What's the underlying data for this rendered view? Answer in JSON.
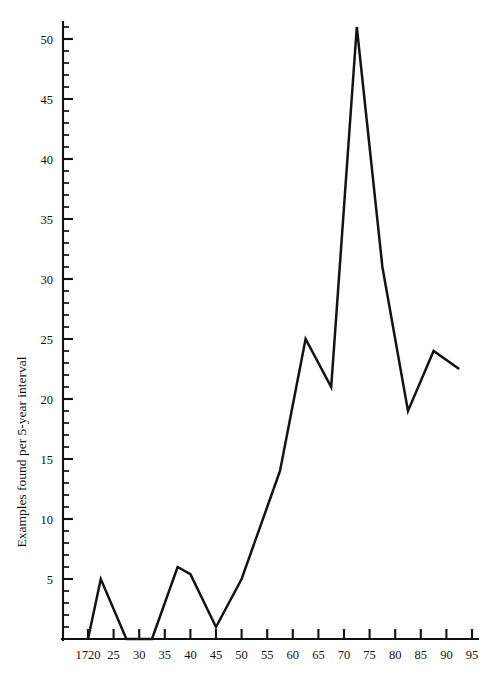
{
  "chart_data": {
    "type": "line",
    "title": "",
    "subtitle": "",
    "xlabel": "",
    "ylabel": "Examples found per 5-year interval",
    "xlim": [
      1715,
      1797
    ],
    "ylim": [
      0,
      52
    ],
    "grid": false,
    "legend": null,
    "annotations": [],
    "x_tick_labels": [
      "1720",
      "25",
      "30",
      "35",
      "40",
      "45",
      "50",
      "55",
      "60",
      "65",
      "70",
      "75",
      "80",
      "85",
      "90",
      "95"
    ],
    "x_tick_values": [
      1720,
      1725,
      1730,
      1735,
      1740,
      1745,
      1750,
      1755,
      1760,
      1765,
      1770,
      1775,
      1780,
      1785,
      1790,
      1795
    ],
    "y_tick_labels": [
      "5",
      "10",
      "15",
      "20",
      "25",
      "30",
      "35",
      "40",
      "45",
      "50"
    ],
    "y_tick_values": [
      5,
      10,
      15,
      20,
      25,
      30,
      35,
      40,
      45,
      50
    ],
    "y_minor_step": 1,
    "series": [
      {
        "name": "Examples found per 5-year interval",
        "color": "#131313",
        "x": [
          1720,
          1722.5,
          1727.5,
          1732.5,
          1737.5,
          1740,
          1745,
          1750,
          1755,
          1757.5,
          1762.5,
          1767.5,
          1772.5,
          1777.5,
          1782.5,
          1787.5,
          1792.5
        ],
        "values": [
          0,
          5,
          0,
          0,
          6,
          5.4,
          1,
          5,
          11,
          14,
          25,
          21,
          51,
          31,
          19,
          24,
          22.5
        ]
      }
    ]
  },
  "axes": {
    "y_axis_title": "Examples found per 5-year interval"
  }
}
